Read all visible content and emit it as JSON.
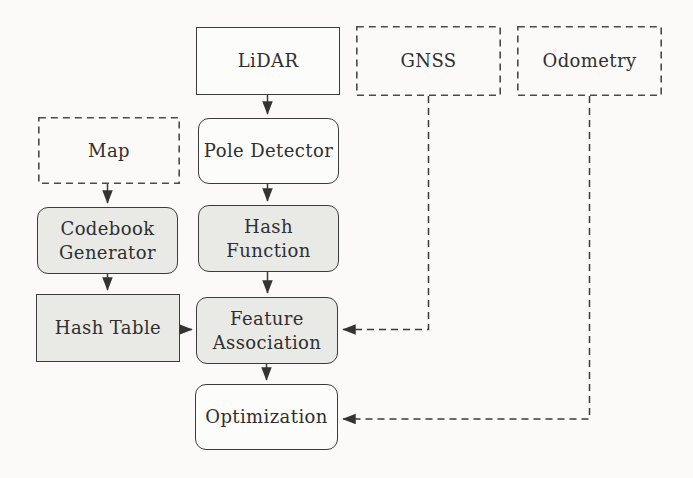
{
  "figure": {
    "type": "flow-diagram",
    "colors": {
      "background": "#fbfaf8",
      "box_border": "#3c3c3c",
      "shaded_fill": "#e9e9e6",
      "white_fill": "#fcfcfa",
      "text": "#2f2f2f"
    }
  },
  "nodes": {
    "lidar": {
      "label": "LiDAR",
      "style": "solid-rect-white"
    },
    "gnss": {
      "label": "GNSS",
      "style": "dashed-rect-white"
    },
    "odometry": {
      "label": "Odometry",
      "style": "dashed-rect-white"
    },
    "map": {
      "label": "Map",
      "style": "dashed-rect-white"
    },
    "pole_detector": {
      "label": "Pole Detector",
      "style": "solid-rounded-white"
    },
    "codebook_generator": {
      "label": "Codebook Generator",
      "style": "solid-rounded-shaded"
    },
    "hash_function": {
      "label": "Hash Function",
      "style": "solid-rounded-shaded"
    },
    "hash_table": {
      "label": "Hash Table",
      "style": "solid-rect-shaded"
    },
    "feature_association": {
      "label": "Feature Association",
      "style": "solid-rounded-shaded"
    },
    "optimization": {
      "label": "Optimization",
      "style": "solid-rounded-white"
    }
  },
  "edges": [
    {
      "from": "lidar",
      "to": "pole_detector",
      "style": "solid-arrow"
    },
    {
      "from": "pole_detector",
      "to": "hash_function",
      "style": "solid-arrow"
    },
    {
      "from": "hash_function",
      "to": "feature_association",
      "style": "solid-arrow"
    },
    {
      "from": "map",
      "to": "codebook_generator",
      "style": "solid-arrow"
    },
    {
      "from": "codebook_generator",
      "to": "hash_table",
      "style": "solid-arrow"
    },
    {
      "from": "hash_table",
      "to": "feature_association",
      "style": "solid-arrow"
    },
    {
      "from": "feature_association",
      "to": "optimization",
      "style": "solid-arrow"
    },
    {
      "from": "gnss",
      "to": "feature_association",
      "style": "dashed-arrow"
    },
    {
      "from": "odometry",
      "to": "optimization",
      "style": "dashed-arrow"
    }
  ]
}
